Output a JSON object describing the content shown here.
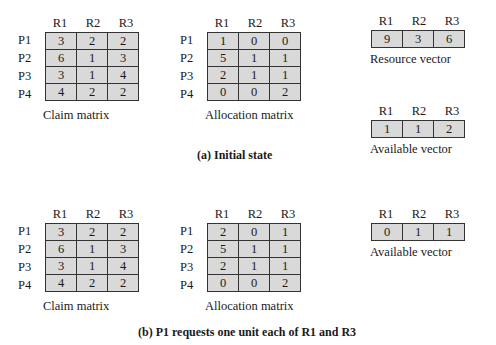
{
  "resources": [
    "R1",
    "R2",
    "R3"
  ],
  "processes": [
    "P1",
    "P2",
    "P3",
    "P4"
  ],
  "initial": {
    "caption": "(a) Initial state",
    "claim": {
      "label": "Claim matrix",
      "rows": [
        [
          3,
          2,
          2
        ],
        [
          6,
          1,
          3
        ],
        [
          3,
          1,
          4
        ],
        [
          4,
          2,
          2
        ]
      ]
    },
    "allocation": {
      "label": "Allocation matrix",
      "rows": [
        [
          1,
          0,
          0
        ],
        [
          5,
          1,
          1
        ],
        [
          2,
          1,
          1
        ],
        [
          0,
          0,
          2
        ]
      ]
    },
    "resource_vector": {
      "label": "Resource vector",
      "values": [
        9,
        3,
        6
      ]
    },
    "available_vector": {
      "label": "Available vector",
      "values": [
        1,
        1,
        2
      ]
    }
  },
  "after_request": {
    "caption": "(b) P1 requests one unit each of R1 and R3",
    "claim": {
      "label": "Claim matrix",
      "rows": [
        [
          3,
          2,
          2
        ],
        [
          6,
          1,
          3
        ],
        [
          3,
          1,
          4
        ],
        [
          4,
          2,
          2
        ]
      ]
    },
    "allocation": {
      "label": "Allocation matrix",
      "rows": [
        [
          2,
          0,
          1
        ],
        [
          5,
          1,
          1
        ],
        [
          2,
          1,
          1
        ],
        [
          0,
          0,
          2
        ]
      ]
    },
    "available_vector": {
      "label": "Available vector",
      "values": [
        0,
        1,
        1
      ]
    }
  }
}
